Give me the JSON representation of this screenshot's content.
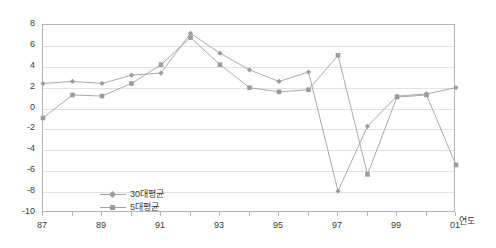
{
  "chart_data": {
    "type": "line",
    "title": "",
    "xlabel": "연도",
    "ylabel": "",
    "x": [
      87,
      88,
      89,
      90,
      91,
      92,
      93,
      94,
      95,
      96,
      97,
      98,
      99,
      100,
      101
    ],
    "categories": [
      "87",
      "88",
      "89",
      "90",
      "91",
      "92",
      "93",
      "94",
      "95",
      "96",
      "97",
      "98",
      "99",
      "00",
      "01"
    ],
    "xtick_labels": [
      "87",
      "89",
      "91",
      "93",
      "95",
      "97",
      "99",
      "01"
    ],
    "xtick_values": [
      87,
      89,
      91,
      93,
      95,
      97,
      99,
      101
    ],
    "ytick_labels": [
      "8",
      "6",
      "4",
      "2",
      "0",
      "-2",
      "-4",
      "-6",
      "-8",
      "-10"
    ],
    "ytick_values": [
      8,
      6,
      4,
      2,
      0,
      -2,
      -4,
      -6,
      -8,
      -10
    ],
    "ylim": [
      -10,
      8
    ],
    "xlim": [
      87,
      101
    ],
    "grid": true,
    "legend_position": "inside-lower-left",
    "series": [
      {
        "name": "30대평균",
        "marker": "diamond",
        "color": "#9b9b9b",
        "values": [
          2.4,
          2.6,
          2.4,
          3.2,
          3.4,
          7.2,
          5.3,
          3.7,
          2.6,
          3.5,
          -7.9,
          -1.7,
          1.2,
          1.4,
          2.0
        ]
      },
      {
        "name": "5대평균",
        "marker": "square",
        "color": "#9b9b9b",
        "values": [
          -0.9,
          1.3,
          1.2,
          2.4,
          4.2,
          6.8,
          4.2,
          2.0,
          1.6,
          1.8,
          5.1,
          -6.3,
          1.1,
          1.3,
          -5.4
        ]
      }
    ]
  },
  "axis": {
    "x_title": "연도"
  },
  "legend": {
    "items": [
      {
        "label": "30대평균",
        "marker": "diamond"
      },
      {
        "label": "5대평균",
        "marker": "square"
      }
    ]
  },
  "style": {
    "grid_color": "#e2e2e2",
    "frame_color": "#b5b5b5",
    "line_color": "#a0a0a0",
    "marker_color": "#9b9b9b",
    "text_color": "#3a3a3a",
    "background": "#ffffff"
  }
}
